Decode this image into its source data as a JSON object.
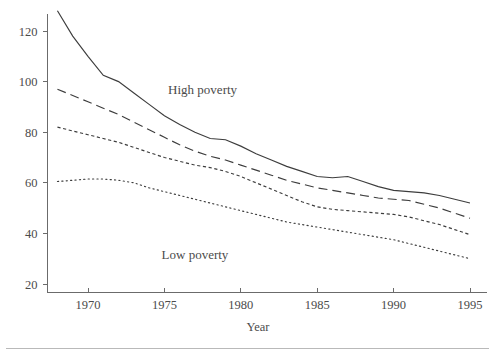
{
  "chart_data": {
    "type": "line",
    "title": "",
    "subtitle": "",
    "xlabel": "Year",
    "ylabel": "",
    "xlim": [
      1967.5,
      1995.5
    ],
    "ylim": [
      18,
      132
    ],
    "grid": false,
    "legend_position": "inline-annotation",
    "xticks": [
      1970,
      1975,
      1980,
      1985,
      1990,
      1995
    ],
    "xtick_labels": [
      "1970",
      "1975",
      "1980",
      "1985",
      "1990",
      "1995"
    ],
    "yticks": [
      20,
      40,
      60,
      80,
      100,
      120
    ],
    "ytick_labels": [
      "20",
      "40",
      "60",
      "80",
      "100",
      "120"
    ],
    "annotations": [
      {
        "text": "High poverty",
        "x": 1977.5,
        "y": 95
      },
      {
        "text": "Low poverty",
        "x": 1977.0,
        "y": 30
      }
    ],
    "x": [
      1968,
      1969,
      1970,
      1971,
      1972,
      1973,
      1974,
      1975,
      1976,
      1977,
      1978,
      1979,
      1980,
      1981,
      1982,
      1983,
      1984,
      1985,
      1986,
      1987,
      1988,
      1989,
      1990,
      1991,
      1992,
      1993,
      1994,
      1995
    ],
    "series": [
      {
        "name": "High poverty",
        "style": "solid",
        "values": [
          128.0,
          118.0,
          110.0,
          102.5,
          100.0,
          95.5,
          91.0,
          86.5,
          83.0,
          80.0,
          77.5,
          77.0,
          74.5,
          71.5,
          69.0,
          66.5,
          64.5,
          62.5,
          62.0,
          62.5,
          60.5,
          58.5,
          57.0,
          56.5,
          56.0,
          55.0,
          53.5,
          52.0
        ]
      },
      {
        "name": "Second highest",
        "style": "long-dash",
        "values": [
          97.0,
          94.5,
          92.0,
          89.5,
          87.0,
          84.0,
          81.0,
          78.0,
          75.0,
          72.5,
          70.5,
          69.0,
          67.0,
          65.0,
          63.0,
          61.0,
          59.5,
          58.0,
          57.0,
          56.0,
          55.0,
          54.0,
          53.5,
          53.0,
          51.5,
          50.0,
          48.0,
          46.0
        ]
      },
      {
        "name": "Third highest",
        "style": "short-dash",
        "values": [
          82.0,
          80.5,
          79.0,
          77.5,
          76.0,
          74.0,
          72.0,
          70.0,
          68.5,
          67.0,
          66.0,
          64.5,
          62.5,
          60.0,
          57.5,
          55.0,
          52.5,
          50.5,
          49.5,
          49.0,
          48.5,
          48.0,
          47.5,
          46.5,
          45.0,
          43.5,
          41.5,
          39.5
        ]
      },
      {
        "name": "Low poverty",
        "style": "dotted",
        "values": [
          60.5,
          61.0,
          61.5,
          61.5,
          61.0,
          60.0,
          58.0,
          56.5,
          55.0,
          53.5,
          52.0,
          50.5,
          49.0,
          47.5,
          46.0,
          44.5,
          43.5,
          42.5,
          41.5,
          40.5,
          39.5,
          38.5,
          37.5,
          36.0,
          34.5,
          33.0,
          31.5,
          30.0
        ]
      }
    ]
  }
}
